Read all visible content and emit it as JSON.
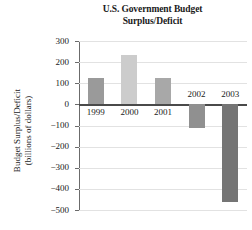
{
  "chart_data": {
    "type": "bar",
    "title": "U.S. Government Budget Surplus/Deficit",
    "title_line1": "U.S. Government Budget",
    "title_line2": "Surplus/Deficit",
    "xlabel": "",
    "ylabel": "Budget Surplus/Deficit (billions of dollars)",
    "ylabel_line1": "Budget Surplus/Deficit",
    "ylabel_line2": "(billions of dollars)",
    "categories": [
      "1999",
      "2000",
      "2001",
      "2002",
      "2003"
    ],
    "values": [
      124,
      236,
      127,
      -110,
      -460
    ],
    "ylim": [
      -500,
      300
    ],
    "yticks": [
      300,
      200,
      100,
      0,
      -100,
      -200,
      -300,
      -400,
      -500
    ],
    "ytick_labels": [
      "300",
      "200",
      "100",
      "0",
      "−100",
      "−200",
      "−300",
      "−400",
      "−500"
    ],
    "grid": true,
    "legend": "none",
    "bar_colors": [
      "#9a9a9a",
      "#cccccc",
      "#a8a8a8",
      "#909090",
      "#757575"
    ]
  }
}
